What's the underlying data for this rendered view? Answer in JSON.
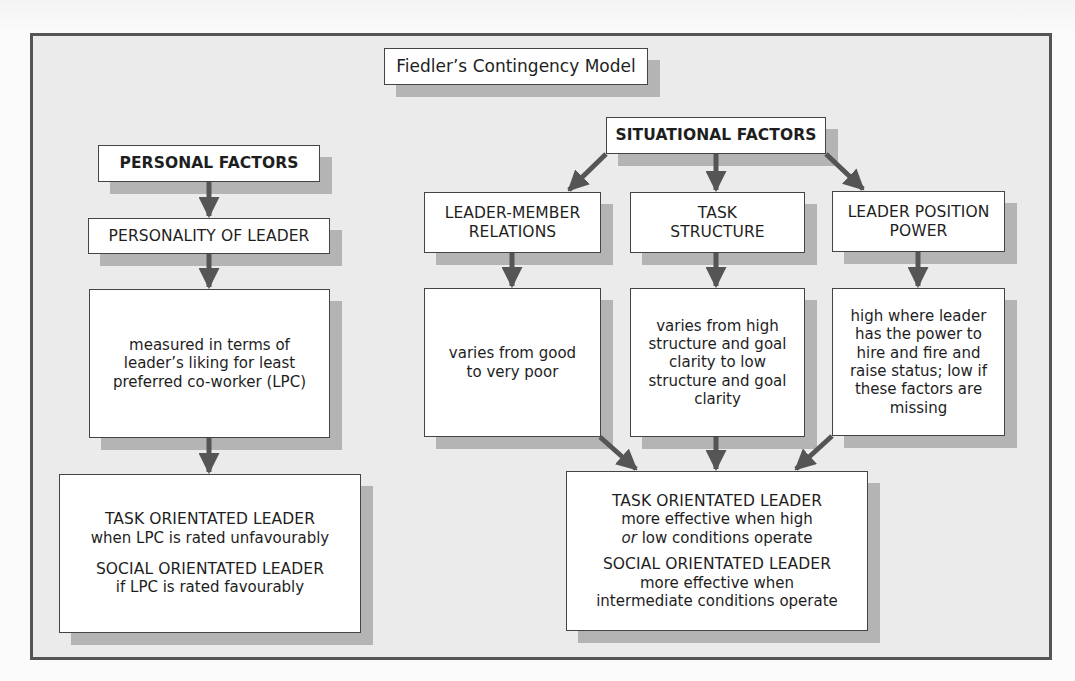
{
  "diagram": {
    "title": "Fiedler’s Contingency Model",
    "colors": {
      "frame_border": "#555555",
      "frame_fill": "#ebebeb",
      "box_fill": "#ffffff",
      "box_shadow": "#b4b4b4",
      "arrow": "#555555"
    },
    "personal": {
      "header": "PERSONAL FACTORS",
      "factor": "PERSONALITY OF LEADER",
      "description": "measured in terms of leader’s liking for least preferred co-worker (LPC)",
      "outcome": {
        "task_title": "TASK ORIENTATED LEADER",
        "task_text": "when LPC is rated unfavourably",
        "social_title": "SOCIAL ORIENTATED LEADER",
        "social_text": "if LPC is rated favourably"
      }
    },
    "situational": {
      "header": "SITUATIONAL FACTORS",
      "factors": [
        {
          "label_line1": "LEADER-MEMBER",
          "label_line2": "RELATIONS",
          "description": "varies from good to very poor"
        },
        {
          "label_line1": "TASK",
          "label_line2": "STRUCTURE",
          "description": "varies from high structure and goal clarity to low structure and goal clarity"
        },
        {
          "label_line1": "LEADER POSITION",
          "label_line2": "POWER",
          "description": "high where leader has the power to hire and fire and raise status; low if these factors are missing"
        }
      ],
      "outcome": {
        "task_title": "TASK ORIENTATED LEADER",
        "task_text_line1": "more effective when high",
        "task_text_or": "or",
        "task_text_line2": " low conditions operate",
        "social_title": "SOCIAL ORIENTATED LEADER",
        "social_text_line1": "more effective when",
        "social_text_line2": "intermediate conditions operate"
      }
    }
  }
}
